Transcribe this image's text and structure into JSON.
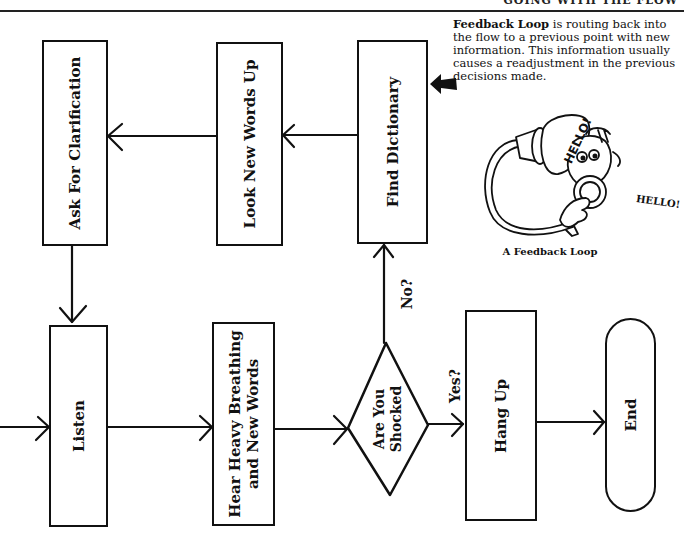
{
  "header": {
    "running_title": "GOING WITH THE FLOW"
  },
  "note": {
    "term": "Feedback Loop",
    "definition": " is routing back into the flow to a previous point with new information. This information usually causes a readjustment in the previous decisions made."
  },
  "illustration": {
    "speech_bubble": "HELLO!",
    "shout": "HELLO!",
    "caption": "A Feedback Loop"
  },
  "flowchart": {
    "nodes": [
      {
        "id": "ask",
        "label": "Ask For Clarification",
        "shape": "rectangle"
      },
      {
        "id": "look",
        "label": "Look New Words Up",
        "shape": "rectangle"
      },
      {
        "id": "find",
        "label": "Find Dictionary",
        "shape": "rectangle"
      },
      {
        "id": "listen",
        "label": "Listen",
        "shape": "rectangle"
      },
      {
        "id": "hear",
        "label_line1": "Hear Heavy Breathing",
        "label_line2": "and New Words",
        "shape": "rectangle"
      },
      {
        "id": "shocked",
        "label_line1": "Are You",
        "label_line2": "Shocked",
        "shape": "diamond"
      },
      {
        "id": "hangup",
        "label": "Hang Up",
        "shape": "rectangle"
      },
      {
        "id": "end",
        "label": "End",
        "shape": "terminal"
      }
    ],
    "edges": [
      {
        "from": "entry",
        "to": "listen",
        "label": ""
      },
      {
        "from": "listen",
        "to": "hear",
        "label": ""
      },
      {
        "from": "hear",
        "to": "shocked",
        "label": ""
      },
      {
        "from": "shocked",
        "to": "find",
        "label": "No?"
      },
      {
        "from": "shocked",
        "to": "hangup",
        "label": "Yes?"
      },
      {
        "from": "hangup",
        "to": "end",
        "label": ""
      },
      {
        "from": "find",
        "to": "look",
        "label": ""
      },
      {
        "from": "look",
        "to": "ask",
        "label": ""
      },
      {
        "from": "ask",
        "to": "listen",
        "label": ""
      }
    ],
    "edge_labels": {
      "no": "No?",
      "yes": "Yes?"
    }
  }
}
